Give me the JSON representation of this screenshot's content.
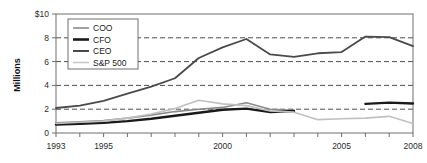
{
  "chart_data": {
    "type": "line",
    "title": "",
    "xlabel": "",
    "ylabel": "Millions",
    "xlim": [
      1993,
      2008
    ],
    "ylim": [
      0,
      10
    ],
    "grid": "horizontal-dashed",
    "legend_position": "top-left",
    "x": [
      1993,
      1994,
      1995,
      1996,
      1997,
      1998,
      1999,
      2000,
      2001,
      2002,
      2003,
      2004,
      2005,
      2006,
      2007,
      2008
    ],
    "y_ticks": [
      {
        "value": 10,
        "label": "$10"
      },
      {
        "value": 8,
        "label": "8"
      },
      {
        "value": 6,
        "label": "6"
      },
      {
        "value": 4,
        "label": "4"
      },
      {
        "value": 2,
        "label": "2"
      },
      {
        "value": 0,
        "label": "0"
      }
    ],
    "x_ticks": [
      {
        "value": 1993,
        "label": "1993"
      },
      {
        "value": 1994,
        "label": ""
      },
      {
        "value": 1995,
        "label": "1995"
      },
      {
        "value": 1996,
        "label": ""
      },
      {
        "value": 1997,
        "label": ""
      },
      {
        "value": 1998,
        "label": ""
      },
      {
        "value": 1999,
        "label": ""
      },
      {
        "value": 2000,
        "label": "2000"
      },
      {
        "value": 2001,
        "label": ""
      },
      {
        "value": 2002,
        "label": ""
      },
      {
        "value": 2003,
        "label": ""
      },
      {
        "value": 2004,
        "label": ""
      },
      {
        "value": 2005,
        "label": "2005"
      },
      {
        "value": 2006,
        "label": ""
      },
      {
        "value": 2007,
        "label": ""
      },
      {
        "value": 2008,
        "label": "2008"
      }
    ],
    "series": [
      {
        "name": "COO",
        "color": "#8a8a8a",
        "width": 1.6,
        "x": [
          1993,
          1994,
          1995,
          1996,
          1997,
          1998,
          1999,
          2000,
          2001,
          2002,
          2003
        ],
        "values": [
          0.85,
          0.95,
          1.05,
          1.25,
          1.5,
          1.8,
          2.0,
          2.15,
          2.55,
          2.0,
          1.9
        ]
      },
      {
        "name": "CFO",
        "color": "#1a1a1a",
        "width": 2.4,
        "x": [
          1993,
          1994,
          1995,
          1996,
          1997,
          1998,
          1999,
          2000,
          2001,
          2002,
          2003
        ],
        "values": [
          0.7,
          0.78,
          0.85,
          1.0,
          1.2,
          1.45,
          1.7,
          1.95,
          2.05,
          1.75,
          1.85
        ]
      },
      {
        "name": "CFO-late",
        "color": "#1a1a1a",
        "width": 2.4,
        "x": [
          2006,
          2007,
          2008
        ],
        "values": [
          2.45,
          2.55,
          2.48
        ]
      },
      {
        "name": "CEO",
        "color": "#4a4a4a",
        "width": 1.8,
        "x": [
          1993,
          1994,
          1995,
          1996,
          1997,
          1998,
          1999,
          2000,
          2001,
          2002,
          2003,
          2004,
          2005,
          2006,
          2007,
          2008
        ],
        "values": [
          2.1,
          2.3,
          2.7,
          3.3,
          3.9,
          4.6,
          6.3,
          7.2,
          7.9,
          6.6,
          6.4,
          6.7,
          6.8,
          8.1,
          8.05,
          7.3
        ]
      },
      {
        "name": "S&P 500",
        "color": "#c0c0c0",
        "width": 1.6,
        "x": [
          1993,
          1994,
          1995,
          1996,
          1997,
          1998,
          1999,
          2000,
          2001,
          2002,
          2003,
          2004,
          2005,
          2006,
          2007,
          2008
        ],
        "values": [
          0.8,
          0.9,
          1.0,
          1.25,
          1.6,
          2.05,
          2.75,
          2.45,
          2.3,
          1.85,
          1.75,
          1.12,
          1.2,
          1.25,
          1.4,
          0.8
        ]
      }
    ],
    "legend": [
      {
        "label": "COO",
        "color": "#8a8a8a",
        "width": 1.6
      },
      {
        "label": "CFO",
        "color": "#1a1a1a",
        "width": 2.6
      },
      {
        "label": "CEO",
        "color": "#4a4a4a",
        "width": 2.0
      },
      {
        "label": "S&P 500",
        "color": "#c8c8c8",
        "width": 1.6
      }
    ]
  }
}
